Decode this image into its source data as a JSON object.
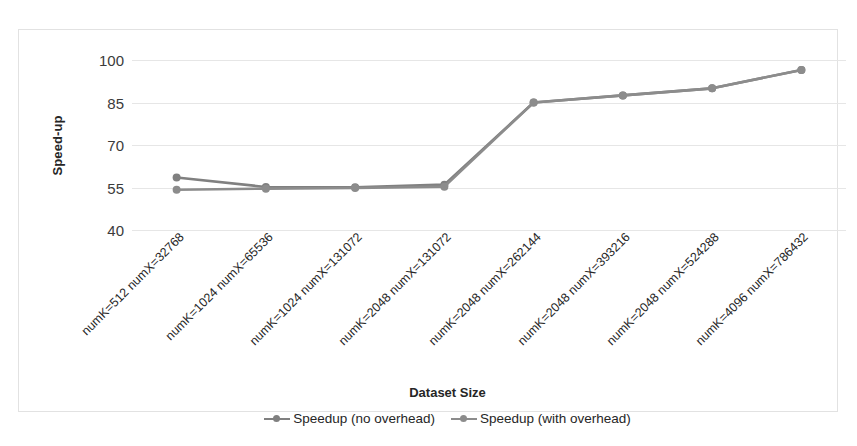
{
  "chart_data": {
    "type": "line",
    "title": "",
    "xlabel": "Dataset Size",
    "ylabel": "Speed-up",
    "ylim": [
      40,
      100
    ],
    "yticks": [
      100,
      85,
      70,
      55,
      40
    ],
    "grid": true,
    "legend_position": "bottom",
    "legend": [
      "Speedup (no overhead)",
      "Speedup (with overhead)"
    ],
    "categories": [
      "numK=512 numX=32768",
      "numK=1024 numX=65536",
      "numK=1024 numX=131072",
      "numK=2048 numX=131072",
      "numK=2048 numX=262144",
      "numK=2048 numX=393216",
      "numK=2048 numX=524288",
      "numK=4096 numX=786432"
    ],
    "series": [
      {
        "name": "Speedup (no overhead)",
        "color": "#808080",
        "values": [
          58.5,
          55.2,
          55.1,
          56.0,
          85.0,
          87.5,
          90.0,
          96.5
        ]
      },
      {
        "name": "Speedup (with overhead)",
        "color": "#8c8c8c",
        "values": [
          54.2,
          54.6,
          54.8,
          55.3,
          85.0,
          87.5,
          90.0,
          96.5
        ]
      }
    ]
  },
  "colors": {
    "series_no_overhead": "#808080",
    "series_with_overhead": "#8c8c8c",
    "gridline": "#e6e6e6",
    "frame": "#e2e2e2",
    "text": "#262626"
  }
}
